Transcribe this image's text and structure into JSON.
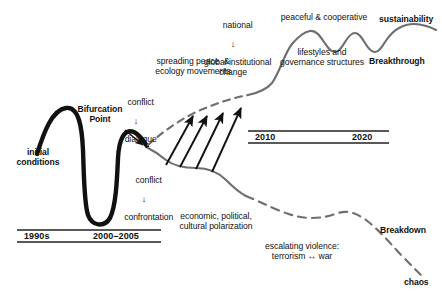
{
  "figure": {
    "background_color": "#ffffff",
    "line_colors": {
      "initial_path": "#111111",
      "breakthrough_path": "#6e6e6e",
      "breakdown_path": "#6e6e6e",
      "arrows": "#111111",
      "timeline_rule": "#222222"
    }
  },
  "labels": {
    "initial_conditions": "initial\nconditions",
    "bifurcation_point": "Bifurcation\nPoint",
    "conflict_dialogue_top": "conflict",
    "conflict_dialogue_arrow": "↓",
    "conflict_dialogue_bottom": "dialogue",
    "conflict_confrontation_top": "conflict",
    "conflict_confrontation_arrow": "↓",
    "conflict_confrontation_bottom": "confrontation",
    "spreading_peace": "spreading peace  &\necology movements",
    "national": "national",
    "national_arrow": "↓",
    "global_change": "global institutional\nchange",
    "peaceful_cooperative": "peaceful & cooperative",
    "lifestyles_governance": "lifestyles and\ngovernance structures",
    "sustainability": "sustainability",
    "breakthrough": "Breakthrough",
    "economic_polarization": "economic, political,\ncultural polarization",
    "escalating_violence": "escalating violence:\nterrorism ↔ war",
    "breakdown": "Breakdown",
    "chaos": "chaos"
  },
  "timelines": [
    {
      "name": "lower-timeline",
      "ticks": [
        "1990s",
        "2000–2005"
      ]
    },
    {
      "name": "upper-timeline",
      "ticks": [
        "2010",
        "2020"
      ]
    }
  ],
  "paths": {
    "initial_conditions_curve": "thick black curve rising to a peak, plunging into a deep valley, then rising to the bifurcation point",
    "breakthrough_branch": "dashed gray line rising from bifurcation point, becoming a solid gray wavy curve that oscillates and rises to sustainability",
    "breakdown_branch": "solid gray line descending from bifurcation point, becoming a dashed gray line that declines to chaos",
    "transition_arrows": {
      "count": 4,
      "description": "four diagonal black arrows pointing from the breakdown path up to the breakthrough path"
    }
  }
}
